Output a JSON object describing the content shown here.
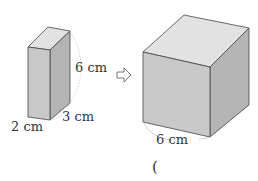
{
  "figure": {
    "cuboid": {
      "height_label": "6 cm",
      "width_label": "2 cm",
      "depth_label": "3 cm"
    },
    "arrow": "⇨",
    "cube": {
      "edge_label": "6 cm"
    },
    "answer_blank": "("
  },
  "colors": {
    "front_face": "#c8c8c8",
    "top_face": "#e2e2e2",
    "side_face": "#b4b4b4",
    "edge": "#444444",
    "dim_arc": "#bbbbbb",
    "text": "#333333"
  }
}
